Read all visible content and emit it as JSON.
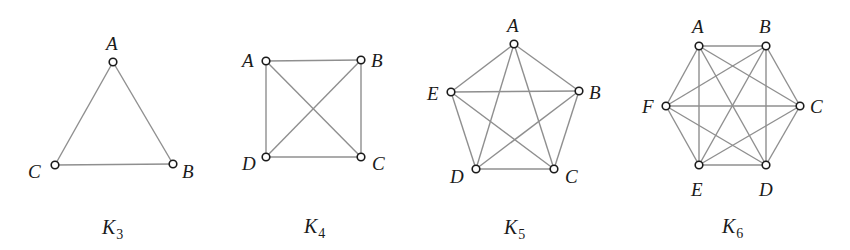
{
  "graphs": [
    {
      "name": "K3",
      "label": "K",
      "subscript": "3",
      "label_pos": [
        102,
        234
      ],
      "nodes": [
        {
          "id": "A",
          "x": 113,
          "y": 62,
          "lx": 106,
          "ly": 50
        },
        {
          "id": "B",
          "x": 173,
          "y": 164,
          "lx": 182,
          "ly": 178
        },
        {
          "id": "C",
          "x": 55,
          "y": 165,
          "lx": 28,
          "ly": 178
        }
      ]
    },
    {
      "name": "K4",
      "label": "K",
      "subscript": "4",
      "label_pos": [
        304,
        233
      ],
      "nodes": [
        {
          "id": "A",
          "x": 266,
          "y": 61,
          "lx": 242,
          "ly": 67
        },
        {
          "id": "B",
          "x": 361,
          "y": 60,
          "lx": 371,
          "ly": 67
        },
        {
          "id": "C",
          "x": 361,
          "y": 157,
          "lx": 372,
          "ly": 170
        },
        {
          "id": "D",
          "x": 266,
          "y": 157,
          "lx": 242,
          "ly": 170
        }
      ]
    },
    {
      "name": "K5",
      "label": "K",
      "subscript": "5",
      "label_pos": [
        504,
        234
      ],
      "nodes": [
        {
          "id": "A",
          "x": 514,
          "y": 44,
          "lx": 507,
          "ly": 32
        },
        {
          "id": "B",
          "x": 579,
          "y": 91,
          "lx": 589,
          "ly": 99
        },
        {
          "id": "C",
          "x": 554,
          "y": 169,
          "lx": 565,
          "ly": 183
        },
        {
          "id": "D",
          "x": 476,
          "y": 169,
          "lx": 450,
          "ly": 183
        },
        {
          "id": "E",
          "x": 451,
          "y": 92,
          "lx": 427,
          "ly": 100
        }
      ]
    },
    {
      "name": "K6",
      "label": "K",
      "subscript": "6",
      "label_pos": [
        722,
        233
      ],
      "nodes": [
        {
          "id": "A",
          "x": 699,
          "y": 46,
          "lx": 692,
          "ly": 33
        },
        {
          "id": "B",
          "x": 766,
          "y": 46,
          "lx": 759,
          "ly": 33
        },
        {
          "id": "C",
          "x": 800,
          "y": 106,
          "lx": 810,
          "ly": 113
        },
        {
          "id": "D",
          "x": 766,
          "y": 165,
          "lx": 759,
          "ly": 196
        },
        {
          "id": "E",
          "x": 699,
          "y": 165,
          "lx": 691,
          "ly": 196
        },
        {
          "id": "F",
          "x": 666,
          "y": 106,
          "lx": 642,
          "ly": 113
        }
      ]
    }
  ],
  "colors": {
    "edge": "#8f8f8f",
    "node_stroke": "#1a1a1a",
    "text": "#1a1a1a",
    "background": "#ffffff"
  }
}
